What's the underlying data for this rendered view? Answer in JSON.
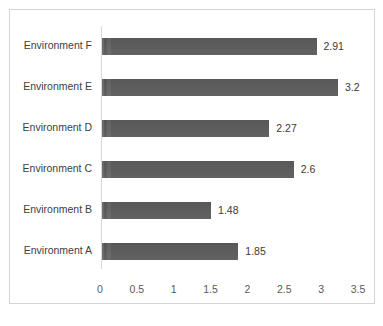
{
  "chart_data": {
    "type": "bar",
    "orientation": "horizontal",
    "title": "",
    "xlabel": "",
    "ylabel": "",
    "categories": [
      "Environment A",
      "Environment B",
      "Environment C",
      "Environment D",
      "Environment E",
      "Environment F"
    ],
    "values": [
      1.85,
      1.48,
      2.6,
      2.27,
      3.2,
      2.91
    ],
    "value_labels": [
      "1.85",
      "1.48",
      "2.6",
      "2.27",
      "3.2",
      "2.91"
    ],
    "display_order_top_to_bottom": [
      "Environment F",
      "Environment E",
      "Environment D",
      "Environment C",
      "Environment B",
      "Environment A"
    ],
    "xlim": [
      0,
      3.5
    ],
    "xticks": [
      0,
      0.5,
      1,
      1.5,
      2,
      2.5,
      3,
      3.5
    ],
    "xtick_labels": [
      "0",
      "0.5",
      "1",
      "1.5",
      "2",
      "2.5",
      "3",
      "3.5"
    ],
    "grid": false,
    "legend": false,
    "bar_color": "#5d5d5d",
    "plot_border_color": "#d4d4d4",
    "axis_line_color": "#d9d9d9",
    "label_color": "#404040"
  },
  "bars": [
    {
      "category": "Environment F",
      "value": 2.91,
      "label": "2.91"
    },
    {
      "category": "Environment E",
      "value": 3.2,
      "label": "3.2"
    },
    {
      "category": "Environment D",
      "value": 2.27,
      "label": "2.27"
    },
    {
      "category": "Environment C",
      "value": 2.6,
      "label": "2.6"
    },
    {
      "category": "Environment B",
      "value": 1.48,
      "label": "1.48"
    },
    {
      "category": "Environment A",
      "value": 1.85,
      "label": "1.85"
    }
  ],
  "caption": {
    "fragment": ""
  }
}
